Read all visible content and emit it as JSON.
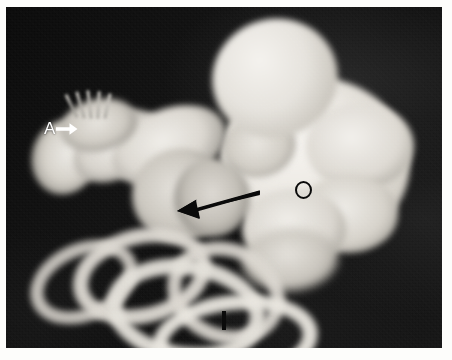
{
  "figure": {
    "kind": "photograph",
    "subject_description": "Black-and-white photograph of a dissected embryonic/fetal specimen showing a large pale body mass at right and coiled intestinal loops at lower left, set against a dark background.",
    "background_color": "#0a0a0a",
    "plate_border_color": "#ffffff",
    "specimen_color": "#ece9e3"
  },
  "annotations": [
    {
      "id": "label-a",
      "text": "A",
      "marker": "white-arrow-right",
      "color": "#ffffff",
      "x": 40,
      "y": 120,
      "meaning": "arrow points to limb bud with digital rays"
    },
    {
      "id": "pointer-black-arrow",
      "text": "",
      "marker": "black-arrow-left",
      "color": "#0a0a0a",
      "x": 168,
      "y": 200,
      "meaning": "arrow points to mid specimen structure"
    },
    {
      "id": "label-o",
      "text": "O",
      "marker": "black-circle-outline",
      "color": "#0a0a0a",
      "x": 289,
      "y": 174,
      "meaning": "circle marks a region of the large pale mass"
    },
    {
      "id": "label-i",
      "text": "I",
      "marker": "black-vertical-bar",
      "color": "#0b0b0b",
      "x": 216,
      "y": 304,
      "meaning": "bar marks an intestinal loop"
    }
  ],
  "plate": {
    "left": 6,
    "top": 7,
    "width": 436,
    "height": 341
  }
}
